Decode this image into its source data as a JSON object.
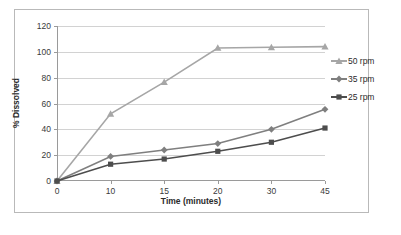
{
  "chart_data": {
    "type": "line",
    "title": "",
    "xlabel": "Time (minutes)",
    "ylabel": "% Dissolved",
    "categories": [
      "0",
      "10",
      "15",
      "20",
      "30",
      "45"
    ],
    "x": [
      0,
      10,
      15,
      20,
      30,
      45
    ],
    "yticks": [
      "0",
      "20",
      "40",
      "60",
      "80",
      "100",
      "120"
    ],
    "ylim": [
      0,
      120
    ],
    "grid": "horizontal",
    "legend_position": "right",
    "series": [
      {
        "name": "50 rpm",
        "values": [
          0,
          52,
          76.5,
          103,
          103.5,
          104
        ],
        "color": "#a6a6a6",
        "marker": "triangle"
      },
      {
        "name": "35 rpm",
        "values": [
          0,
          19,
          24,
          29,
          40,
          55.5
        ],
        "color": "#7f7f7f",
        "marker": "diamond"
      },
      {
        "name": "25 rpm",
        "values": [
          0,
          13,
          17,
          23,
          30,
          41
        ],
        "color": "#4d4d4d",
        "marker": "square"
      }
    ]
  },
  "legend": {
    "items": [
      {
        "label": "50 rpm"
      },
      {
        "label": "35 rpm"
      },
      {
        "label": "25 rpm"
      }
    ]
  }
}
